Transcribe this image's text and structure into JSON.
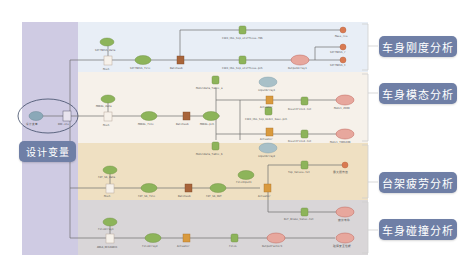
{
  "diagram": {
    "left_panel_label": "设计变量",
    "analysis_labels": [
      {
        "id": "stiffness",
        "label": "车身刚度分析"
      },
      {
        "id": "modal",
        "label": "车身模态分析"
      },
      {
        "id": "fatigue",
        "label": "台架疲劳分析"
      },
      {
        "id": "crash",
        "label": "车身碰撞分析"
      }
    ],
    "colors": {
      "left_panel": "#cfcbe3",
      "band_stiffness": "#e8eef6",
      "band_modal": "#f6f1ea",
      "band_fatigue": "#efe0c2",
      "band_crash": "#d9d6d8",
      "label_bg": "#6f7fa6",
      "node_green": "#8db45a",
      "node_brown": "#a8643a",
      "node_orange": "#d98a3a",
      "node_red": "#d9786a",
      "node_blue": "#8aa8b8",
      "line": "#6e6e6e"
    },
    "nodes": {
      "design_var_in": "设计变量",
      "design_var_box": "DOE.xls",
      "stiff_data": "SIFFNESS_data",
      "stiff_mesh": "Mesh",
      "stiff_file": "SIFFNESS_file",
      "stiff_batch": "Batchsub",
      "stiff_res1": "C101_HSL_hip_stiffness.f06",
      "stiff_res2": "C101_HSL_hip_stiffness.pch",
      "stiff_out": "OutputArray1",
      "stiff_r1": "Mass_res",
      "stiff_r2": "SIFFNESS_r",
      "stiff_r3": "SIFFNESS_t",
      "modal_data": "MODAL_data",
      "modal_mesh": "Mesh",
      "modal_file": "MODAL_file",
      "modal_batch": "Batchsub",
      "modal_pch": "MODAL.pch",
      "modal_model_a": "Modeldata_Table_a",
      "modal_model_b": "Modeldata_Table_b",
      "modal_in1": "inputArray1",
      "modal_in2": "inputArray2",
      "modal_act1": "Actuator",
      "modal_act2": "Actuator",
      "modal_mid": "C101_HSL_hip_model_base.pch",
      "modal_res1": "ResultFile1.txt",
      "modal_res2": "ResultFile2.txt",
      "modal_r1": "Model_ZERO",
      "modal_r2": "Model_TORSION",
      "fat_data": "FAT_SA_data",
      "fat_mesh": "Mesh",
      "fat_file": "FAT_SA_file",
      "fat_batch": "Batchsub",
      "fat_out": "FAT_SA_OUT",
      "fat_input": "FileInput1",
      "fat_act": "Actuator",
      "fat_res1": "Top_Values.txt",
      "fat_res2": "Def_Brake_Value.txt",
      "fat_r1": "最大损伤值",
      "fat_r2": "疲劳寿命",
      "crash_data": "FileArray1",
      "crash_mesh": "ANSA_DESIGNV1",
      "crash_file": "FileArray2",
      "crash_act": "Actuator",
      "crash_res": "FileL",
      "crash_out": "OutputFactor1",
      "crash_r": "碰撞安全性能"
    }
  }
}
